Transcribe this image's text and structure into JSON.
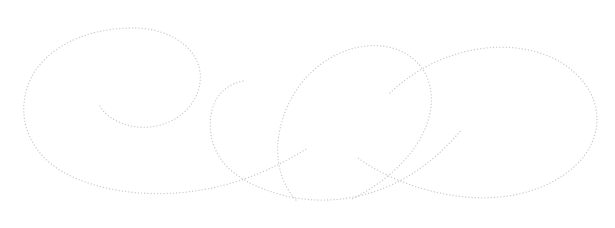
{
  "canvas": {
    "width": 615,
    "height": 228,
    "background_color": "#ffffff",
    "title": "Dotted Flourish Ornament"
  },
  "artwork": {
    "name": "dotted-calligraphic-flourish",
    "description": "Decorative calligraphic flourish drawn as a single dotted stroke forming a left spiral, a central hook, a crossing diagonal and a large right oval loop",
    "stroke_color": "#c9c9cf",
    "stroke_width": 1.3,
    "dot_pattern": "0.1 3.1",
    "dot_spacing_px": 3.2,
    "dot_radius_px": 0.65,
    "stroke_style": "dotted",
    "fill": "none",
    "element_count": 4,
    "crossing_points": [
      {
        "name": "lower-left-crossing",
        "x": 248,
        "y": 178
      },
      {
        "name": "right-crossing",
        "x": 340,
        "y": 128
      }
    ],
    "bounding_box": {
      "x": 25,
      "y": 25,
      "width": 570,
      "height": 180
    },
    "paths": [
      {
        "name": "left-spiral-loop",
        "d": "M 100 106 C 108 121 133 131 156 126 C 186 120 203 95 200 72 C 196 44 165 27 130 28 C 82 29 41 50 28 85 C 16 119 30 153 63 172 C 101 193 154 198 201 190 C 243 183 277 167 306 149"
      },
      {
        "name": "center-hook",
        "d": "M 243 81 C 228 84 216 94 212 110 C 206 133 215 158 233 172 C 248 184 266 191 286 196 C 321 204 357 200 389 186 C 419 173 443 152 462 129"
      },
      {
        "name": "top-middle-loop",
        "d": "M 296 200 C 276 178 273 146 284 115 C 294 86 316 62 345 51 C 375 40 405 46 421 67 C 436 87 434 114 420 139 C 405 165 380 185 352 199"
      },
      {
        "name": "right-oval-loop",
        "d": "M 390 93 C 412 72 441 56 473 50 C 519 41 563 54 585 84 C 604 110 600 142 576 165 C 550 190 508 201 466 197 C 424 193 386 178 358 158"
      }
    ]
  }
}
